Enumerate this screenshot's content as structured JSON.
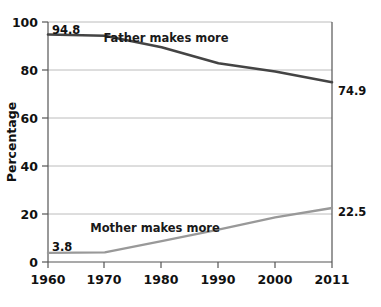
{
  "chart_data": {
    "type": "line",
    "title": "",
    "xlabel": "",
    "ylabel": "Percentage",
    "xlim": [
      1960,
      2011
    ],
    "ylim": [
      0,
      100
    ],
    "grid": true,
    "legend_position": "inline-annotations",
    "x": [
      1960,
      1970,
      1980,
      1990,
      2000,
      2011
    ],
    "xticklabels": [
      "1960",
      "1970",
      "1980",
      "1990",
      "2000",
      "2011"
    ],
    "yticks": [
      0,
      20,
      40,
      60,
      80,
      100
    ],
    "yticklabels": [
      "0",
      "20",
      "40",
      "60",
      "80",
      "100"
    ],
    "series": [
      {
        "name": "Father makes more",
        "color": "#444444",
        "values": [
          94.8,
          94.3,
          89.5,
          82.8,
          79.4,
          74.9
        ],
        "start_label": "94.8",
        "end_label": "74.9"
      },
      {
        "name": "Mother makes more",
        "color": "#999999",
        "values": [
          3.8,
          4.0,
          8.7,
          13.5,
          18.6,
          22.5
        ],
        "start_label": "3.8",
        "end_label": "22.5"
      }
    ],
    "annotations": [
      {
        "text": "Father makes more",
        "x": 1981.5,
        "y": 94.0
      },
      {
        "text": "Mother makes more",
        "x": 1975.0,
        "y": 17.0
      },
      {
        "text": "94.8",
        "x": 1960.6,
        "y": 99.0
      },
      {
        "text": "3.8",
        "x": 1960.6,
        "y": 9.5
      },
      {
        "text": "74.9",
        "x": 2012.5,
        "y": 75.5
      },
      {
        "text": "22.5",
        "x": 2012.5,
        "y": 24.0
      }
    ]
  },
  "axes": {
    "ylabel": "Percentage",
    "yticks": [
      "100",
      "80",
      "60",
      "40",
      "20",
      "0"
    ],
    "xticks": [
      "1960",
      "1970",
      "1980",
      "1990",
      "2000",
      "2011"
    ]
  },
  "labels": {
    "father_series": "Father makes more",
    "mother_series": "Mother makes more",
    "father_start": "94.8",
    "father_end": "74.9",
    "mother_start": "3.8",
    "mother_end": "22.5"
  }
}
